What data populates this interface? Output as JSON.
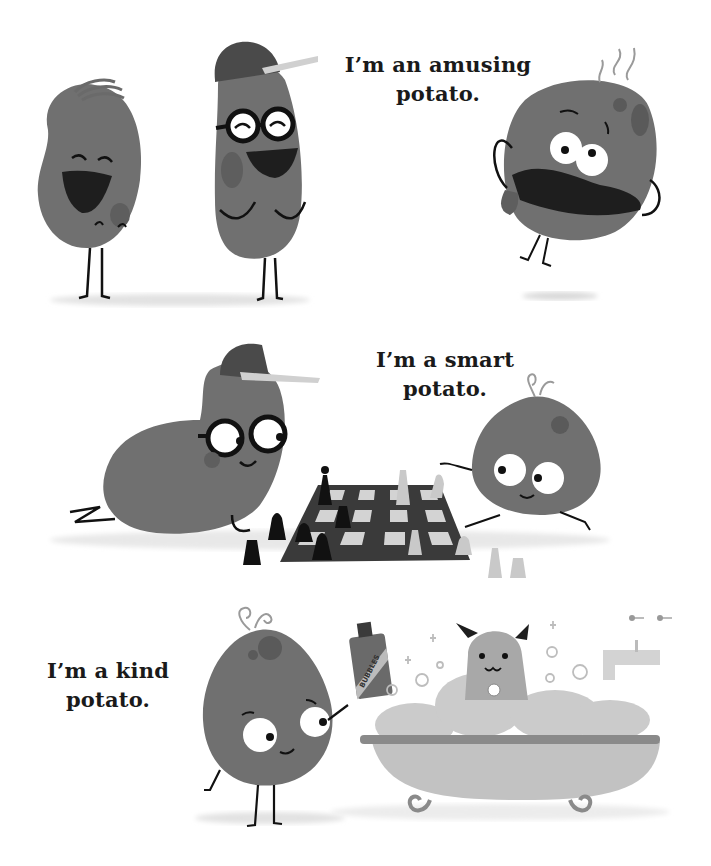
{
  "page": {
    "background": "#ffffff",
    "palette": {
      "ink": "#111111",
      "potato": "#6f6f6f",
      "potato_dark": "#555555",
      "potato_spot": "#5e5e5e",
      "light_gray": "#bdbdbd",
      "shadow": "#e2e2e2",
      "text": "#1a1a1a"
    }
  },
  "scenes": [
    {
      "id": "amusing",
      "caption": {
        "line1": "I’m an amusing",
        "line2": "potato."
      },
      "characters": [
        "laughing-potato-with-hair",
        "laughing-potato-with-cap-and-glasses",
        "silly-face-jumping-potato"
      ]
    },
    {
      "id": "smart",
      "caption": {
        "line1": "I’m a smart",
        "line2": "potato."
      },
      "characters": [
        "potato-with-cap-and-glasses-lying-down",
        "chessboard-with-pieces",
        "curly-sprout-potato-playing-chess"
      ]
    },
    {
      "id": "kind",
      "caption": {
        "line1": "I’m a kind",
        "line2": "potato."
      },
      "characters": [
        "curly-sprout-potato-holding-bottle",
        "dog-in-bubble-bath",
        "clawfoot-bathtub",
        "faucet"
      ],
      "bottle_label": "BUBBLES"
    }
  ]
}
